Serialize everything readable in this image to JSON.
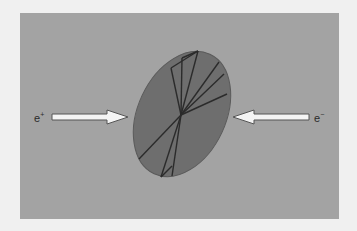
{
  "diagram": {
    "left_particle": {
      "label": "e",
      "charge": "+"
    },
    "right_particle": {
      "label": "e",
      "charge": "−"
    },
    "colors": {
      "page_background": "#f0f0f0",
      "panel_background": "#a3a3a3",
      "disc_fill": "#6e6e6e",
      "track_lines": "#2b2b2b",
      "arrow_fill": "#f4f4f4",
      "arrow_stroke": "#555555"
    }
  }
}
